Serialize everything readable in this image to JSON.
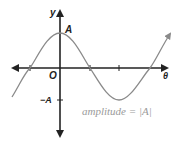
{
  "diagram": {
    "y_axis_label": "y",
    "x_axis_label": "θ",
    "origin_label": "O",
    "peak_label": "A",
    "trough_label": "−A",
    "annotation": "amplitude = |A|",
    "colors": {
      "axes": "#222222",
      "curve": "#8a8a8a",
      "annotation": "#9a9a9a"
    }
  }
}
